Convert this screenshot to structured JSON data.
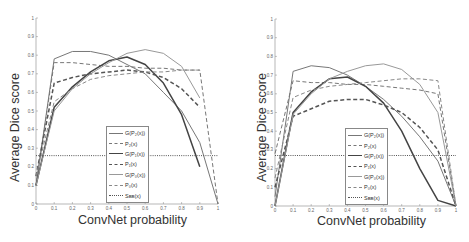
{
  "charts": [
    {
      "xlabel": "ConvNet probability",
      "ylabel": "Average Dice score",
      "legend": [
        "G(P₂(x))",
        "P₂(x)",
        "G(P₁(x))",
        "P₁(x)",
        "G(P₀(x))",
        "P₀(x)",
        "Sʙʙ(x)"
      ]
    },
    {
      "xlabel": "ConvNet probability",
      "ylabel": "Average Dice score",
      "legend": [
        "G(P₂(x))",
        "P₂(x)",
        "G(P₁(x))",
        "P₁(x)",
        "G(P₀(x))",
        "P₀(x)",
        "Sʙʙ(x)"
      ]
    }
  ],
  "chart_data": [
    {
      "type": "line",
      "title": "",
      "xlabel": "ConvNet probability",
      "ylabel": "Average Dice score",
      "xlim": [
        0,
        1
      ],
      "ylim": [
        0,
        1
      ],
      "xticks": [
        "0",
        "0.1",
        "0.2",
        "0.3",
        "0.4",
        "0.5",
        "0.6",
        "0.7",
        "0.8",
        "0.9",
        "1"
      ],
      "yticks": [
        "0",
        "0.1",
        "0.2",
        "0.3",
        "0.4",
        "0.5",
        "0.6",
        "0.7",
        "0.8",
        "0.9",
        "1"
      ],
      "grid": false,
      "legend_position": "lower center",
      "x": [
        0,
        0.1,
        0.2,
        0.3,
        0.4,
        0.5,
        0.6,
        0.7,
        0.8,
        0.9,
        1.0
      ],
      "series": [
        {
          "name": "G(P2(x))",
          "style": "solid",
          "color": "#777777",
          "values": [
            0.1,
            0.78,
            0.82,
            0.82,
            0.8,
            0.75,
            0.7,
            0.6,
            0.5,
            0.33,
            0.0
          ]
        },
        {
          "name": "P2(x)",
          "style": "dashed",
          "color": "#777777",
          "values": [
            0.1,
            0.76,
            0.76,
            0.75,
            0.74,
            0.74,
            0.73,
            0.73,
            0.72,
            0.72,
            0.0
          ]
        },
        {
          "name": "G(P1(x))",
          "style": "solid-thick",
          "color": "#444444",
          "values": [
            0.1,
            0.52,
            0.63,
            0.71,
            0.77,
            0.79,
            0.75,
            0.65,
            0.48,
            0.2,
            null
          ]
        },
        {
          "name": "P1(x)",
          "style": "dashed-thick",
          "color": "#555555",
          "values": [
            0.15,
            0.65,
            0.68,
            0.7,
            0.71,
            0.72,
            0.71,
            0.68,
            0.62,
            0.52,
            null
          ]
        },
        {
          "name": "G(P0(x))",
          "style": "solid",
          "color": "#999999",
          "values": [
            0.1,
            0.5,
            0.62,
            0.7,
            0.76,
            0.81,
            0.83,
            0.81,
            0.74,
            0.57,
            null
          ]
        },
        {
          "name": "P0(x)",
          "style": "dashed",
          "color": "#888888",
          "values": [
            0.15,
            0.55,
            0.62,
            0.67,
            0.69,
            0.7,
            0.71,
            0.71,
            0.72,
            0.72,
            null
          ]
        },
        {
          "name": "SBB(x)",
          "style": "dotted",
          "color": "#555555",
          "values": [
            0.26,
            0.26,
            0.26,
            0.26,
            0.26,
            0.26,
            0.26,
            0.26,
            0.26,
            0.26,
            0.26
          ]
        }
      ]
    },
    {
      "type": "line",
      "title": "",
      "xlabel": "ConvNet probability",
      "ylabel": "Average Dice score",
      "xlim": [
        0,
        1
      ],
      "ylim": [
        0,
        1
      ],
      "xticks": [
        "0",
        "0.1",
        "0.2",
        "0.3",
        "0.4",
        "0.5",
        "0.6",
        "0.7",
        "0.8",
        "0.9",
        "1"
      ],
      "yticks": [
        "0",
        "0.1",
        "0.2",
        "0.3",
        "0.4",
        "0.5",
        "0.6",
        "0.7",
        "0.8",
        "0.9",
        "1"
      ],
      "grid": false,
      "legend_position": "lower center-right",
      "x": [
        0,
        0.1,
        0.2,
        0.3,
        0.4,
        0.5,
        0.6,
        0.7,
        0.8,
        0.9,
        1.0
      ],
      "series": [
        {
          "name": "G(P2(x))",
          "style": "solid",
          "color": "#777777",
          "values": [
            0.05,
            0.72,
            0.75,
            0.74,
            0.7,
            0.64,
            0.57,
            0.48,
            0.37,
            0.24,
            0.0
          ]
        },
        {
          "name": "P2(x)",
          "style": "dashed",
          "color": "#777777",
          "values": [
            0.28,
            0.67,
            0.66,
            0.66,
            0.65,
            0.65,
            0.64,
            0.63,
            0.62,
            0.6,
            0.0
          ]
        },
        {
          "name": "G(P1(x))",
          "style": "solid-thick",
          "color": "#444444",
          "values": [
            0.0,
            0.5,
            0.61,
            0.68,
            0.69,
            0.64,
            0.55,
            0.4,
            0.2,
            0.03,
            0.0
          ]
        },
        {
          "name": "P1(x)",
          "style": "dashed-thick",
          "color": "#555555",
          "values": [
            0.1,
            0.48,
            0.52,
            0.56,
            0.57,
            0.57,
            0.54,
            0.5,
            0.42,
            0.3,
            0.0
          ]
        },
        {
          "name": "G(P0(x))",
          "style": "solid",
          "color": "#999999",
          "values": [
            0.0,
            0.49,
            0.6,
            0.68,
            0.72,
            0.75,
            0.76,
            0.73,
            0.65,
            0.5,
            0.0
          ]
        },
        {
          "name": "P0(x)",
          "style": "dashed",
          "color": "#888888",
          "values": [
            0.15,
            0.58,
            0.62,
            0.64,
            0.65,
            0.66,
            0.67,
            0.68,
            0.68,
            0.67,
            0.0
          ]
        },
        {
          "name": "SBB(x)",
          "style": "dotted",
          "color": "#555555",
          "values": [
            0.27,
            0.27,
            0.27,
            0.27,
            0.27,
            0.27,
            0.27,
            0.27,
            0.27,
            0.27,
            0.27
          ]
        }
      ]
    }
  ]
}
